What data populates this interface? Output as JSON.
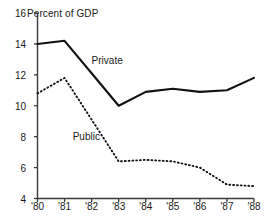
{
  "chart_data": {
    "type": "line",
    "title": "",
    "ylabel": "Percent of GDP",
    "xlabel": "",
    "x": [
      "'80",
      "'81",
      "'82",
      "'83",
      "'84",
      "'85",
      "'86",
      "'87",
      "'88"
    ],
    "xlim": [
      1980,
      1988
    ],
    "ylim": [
      4,
      16
    ],
    "yticks": [
      4,
      6,
      8,
      10,
      12,
      14,
      16
    ],
    "ytick_labels": [
      "4",
      "6",
      "8",
      "10",
      "12",
      "14",
      "16"
    ],
    "xtick_labels": [
      "'80",
      "'81",
      "'82",
      "'83",
      "'84",
      "'85",
      "'86",
      "'87",
      "'88"
    ],
    "grid": false,
    "legend_position": "inline-annotation",
    "series": [
      {
        "name": "Private",
        "style": "solid",
        "color": "#000000",
        "values": [
          14.0,
          14.2,
          12.1,
          10.0,
          10.9,
          11.1,
          10.9,
          11.0,
          11.8
        ]
      },
      {
        "name": "Public",
        "style": "dotted",
        "color": "#000000",
        "values": [
          10.8,
          11.8,
          9.1,
          6.4,
          6.5,
          6.4,
          6.0,
          4.9,
          4.8
        ]
      }
    ],
    "annotations": [
      {
        "text": "Private",
        "x": 1982.0,
        "y": 12.9
      },
      {
        "text": "Public",
        "x": 1981.3,
        "y": 8.0
      }
    ]
  },
  "axis": {
    "y_title": "Percent of GDP"
  }
}
